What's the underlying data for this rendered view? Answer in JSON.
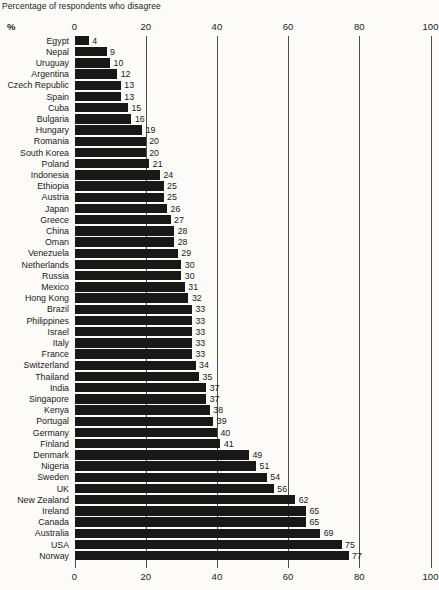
{
  "chart_data": {
    "type": "bar",
    "orientation": "horizontal",
    "title": "Percentage of respondents who disagree",
    "unit_label": "%",
    "xlabel": "",
    "ylabel": "",
    "xlim": [
      0,
      100
    ],
    "x_ticks": [
      0,
      20,
      40,
      60,
      80,
      100
    ],
    "grid": true,
    "grid_values": [
      20,
      40,
      60,
      80,
      100
    ],
    "legend": "none",
    "categories": [
      "Egypt",
      "Nepal",
      "Uruguay",
      "Argentina",
      "Czech Republic",
      "Spain",
      "Cuba",
      "Bulgaria",
      "Hungary",
      "Romania",
      "South Korea",
      "Poland",
      "Indonesia",
      "Ethiopia",
      "Austria",
      "Japan",
      "Greece",
      "China",
      "Oman",
      "Venezuela",
      "Netherlands",
      "Russia",
      "Mexico",
      "Hong Kong",
      "Brazil",
      "Philippines",
      "Israel",
      "Italy",
      "France",
      "Switzerland",
      "Thailand",
      "India",
      "Singapore",
      "Kenya",
      "Portugal",
      "Germany",
      "Finland",
      "Denmark",
      "Nigeria",
      "Sweden",
      "UK",
      "New Zealand",
      "Ireland",
      "Canada",
      "Australia",
      "USA",
      "Norway"
    ],
    "values": [
      4,
      9,
      10,
      12,
      13,
      13,
      15,
      16,
      19,
      20,
      20,
      21,
      24,
      25,
      25,
      26,
      27,
      28,
      28,
      29,
      30,
      30,
      31,
      32,
      33,
      33,
      33,
      33,
      33,
      34,
      35,
      37,
      37,
      38,
      39,
      40,
      41,
      49,
      51,
      54,
      56,
      62,
      65,
      65,
      69,
      75,
      77
    ]
  },
  "colors": {
    "bar": "#181818",
    "text": "#1a1a1a",
    "gridline": "#4d4d4d",
    "background": "#fcfbf8"
  }
}
